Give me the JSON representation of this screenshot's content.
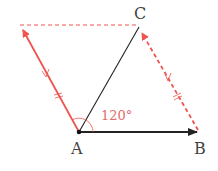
{
  "diagram": {
    "points": {
      "A": {
        "label": "A",
        "x": 79,
        "y": 132
      },
      "B": {
        "label": "B",
        "x": 197,
        "y": 132
      },
      "C": {
        "label": "C",
        "x": 139,
        "y": 27
      },
      "D": {
        "x": 20,
        "y": 25
      }
    },
    "angle_label": "120°",
    "colors": {
      "red": "#f0544f",
      "black": "#222222",
      "angle_text": "#e26a6a"
    }
  }
}
